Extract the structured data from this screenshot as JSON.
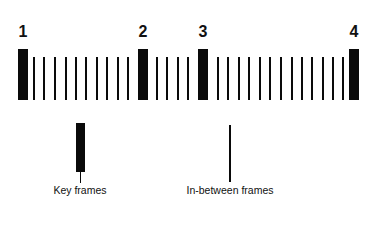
{
  "colors": {
    "ink": "#0a0a0a",
    "background": "#ffffff"
  },
  "key_frames": [
    {
      "label": "1",
      "x": 18
    },
    {
      "label": "2",
      "x": 138
    },
    {
      "label": "3",
      "x": 198
    },
    {
      "label": "4",
      "x": 349
    }
  ],
  "inbetween_frames_x": [
    33,
    43,
    54,
    65,
    75,
    85,
    96,
    106,
    117,
    127,
    156,
    166,
    177,
    187,
    217,
    227,
    238,
    248,
    259,
    269,
    280,
    291,
    301,
    311,
    322,
    332,
    342
  ],
  "legend": {
    "key_frames_label": "Key frames",
    "inbetween_frames_label": "In-between frames"
  }
}
